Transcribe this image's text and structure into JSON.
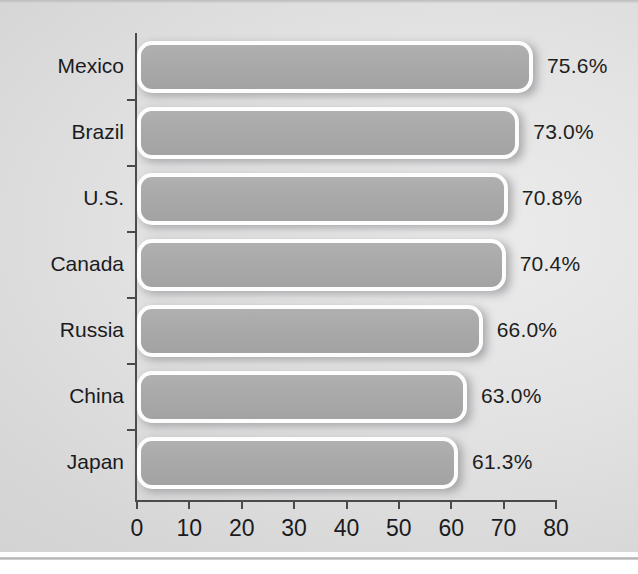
{
  "chart_data": {
    "type": "bar",
    "orientation": "horizontal",
    "title": "",
    "subtitle": "",
    "xlabel": "",
    "ylabel": "",
    "categories": [
      "Mexico",
      "Brazil",
      "U.S.",
      "Canada",
      "Russia",
      "China",
      "Japan"
    ],
    "values": [
      75.6,
      73.0,
      70.8,
      70.4,
      66.0,
      63.0,
      61.3
    ],
    "value_labels": [
      "75.6%",
      "73.0%",
      "70.8%",
      "70.4%",
      "66.0%",
      "63.0%",
      "61.3%"
    ],
    "xlim": [
      0,
      80
    ],
    "xticks": [
      0,
      10,
      20,
      30,
      40,
      50,
      60,
      70,
      80
    ],
    "xtick_labels": [
      "0",
      "10",
      "20",
      "30",
      "40",
      "50",
      "60",
      "70",
      "80"
    ],
    "grid": false,
    "legend": null,
    "colors": {
      "bar_fill": "#a9a9aa",
      "bar_border": "#fdfdfd",
      "axis": "#4a4a4c",
      "text": "#1b1b1d",
      "background": "#dedede"
    }
  }
}
